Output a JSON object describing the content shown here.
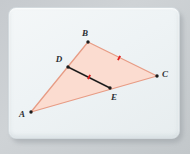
{
  "figure": {
    "card": {
      "background": "#eef3f5",
      "border": "#d3dade"
    },
    "colors": {
      "triangle_fill": "#fbdcd0",
      "triangle_stroke": "#e79c85",
      "segment_stroke": "#1c1c1c",
      "tick_mark": "#e02020",
      "label_text": "#2b2f33",
      "point_dot": "#1c1c1c"
    },
    "points": [
      {
        "id": "A",
        "label": "A",
        "x": 31,
        "y": 112,
        "label_x": 22,
        "label_y": 117
      },
      {
        "id": "B",
        "label": "B",
        "x": 88,
        "y": 42,
        "label_x": 85,
        "label_y": 36
      },
      {
        "id": "C",
        "label": "C",
        "x": 157,
        "y": 76,
        "label_x": 164,
        "label_y": 74
      },
      {
        "id": "D",
        "label": "D",
        "x": 68,
        "y": 67,
        "label_x": 59,
        "label_y": 62
      },
      {
        "id": "E",
        "label": "E",
        "x": 110,
        "y": 88,
        "label_x": 113,
        "label_y": 99
      }
    ],
    "triangle": {
      "vertices": [
        "A",
        "B",
        "C"
      ]
    },
    "segments": [
      {
        "id": "DE",
        "from": "D",
        "to": "E",
        "style": "solid-black",
        "tick_count": 1
      }
    ],
    "tick_marks": [
      {
        "id": "tick-de",
        "on_segment": "DE",
        "x": 89,
        "y": 77,
        "angle": 27
      },
      {
        "id": "tick-bc",
        "on_segment": "BC",
        "x": 119,
        "y": 58,
        "angle": 27
      }
    ]
  }
}
